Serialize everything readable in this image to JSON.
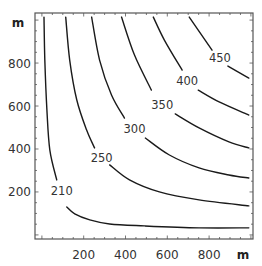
{
  "chart_data": {
    "type": "contour",
    "title": "",
    "xlabel": "m",
    "ylabel": "m",
    "xlim": [
      -33,
      1010
    ],
    "ylim": [
      -19,
      1033
    ],
    "x_ticks": [
      200,
      400,
      600,
      800
    ],
    "y_ticks": [
      200,
      400,
      600,
      800
    ],
    "x_tick_labels": [
      "200",
      "400",
      "600",
      "800"
    ],
    "y_tick_labels": [
      "200",
      "400",
      "600",
      "800"
    ],
    "minor_tick_step": 50,
    "grid": false,
    "legend": "none",
    "contours": [
      {
        "level": 210,
        "label": "210",
        "label_pos": [
          95,
          205
        ],
        "segments": [
          [
            [
              10,
              1014
            ],
            [
              14,
              814
            ],
            [
              24,
              581
            ],
            [
              38,
              395
            ],
            [
              71,
              256
            ]
          ],
          [
            [
              119,
              130
            ],
            [
              157,
              98
            ],
            [
              229,
              70
            ],
            [
              324,
              51
            ],
            [
              490,
              42
            ],
            [
              752,
              33
            ],
            [
              990,
              33
            ]
          ]
        ]
      },
      {
        "level": 250,
        "label": "250",
        "label_pos": [
          286,
          358
        ],
        "segments": [
          [
            [
              114,
              1014
            ],
            [
              133,
              814
            ],
            [
              167,
              628
            ],
            [
              214,
              488
            ],
            [
              252,
              405
            ]
          ],
          [
            [
              324,
              326
            ],
            [
              419,
              256
            ],
            [
              562,
              200
            ],
            [
              752,
              163
            ],
            [
              990,
              135
            ]
          ]
        ]
      },
      {
        "level": 300,
        "label": "300",
        "label_pos": [
          443,
          493
        ],
        "segments": [
          [
            [
              238,
              1014
            ],
            [
              276,
              814
            ],
            [
              333,
              651
            ],
            [
              395,
              544
            ]
          ],
          [
            [
              495,
              451
            ],
            [
              610,
              372
            ],
            [
              752,
              312
            ],
            [
              895,
              279
            ],
            [
              990,
              265
            ]
          ]
        ]
      },
      {
        "level": 350,
        "label": "350",
        "label_pos": [
          576,
          605
        ],
        "segments": [
          [
            [
              381,
              1014
            ],
            [
              443,
              837
            ],
            [
              524,
              674
            ]
          ],
          [
            [
              638,
              563
            ],
            [
              752,
              498
            ],
            [
              895,
              433
            ],
            [
              990,
              405
            ]
          ]
        ]
      },
      {
        "level": 400,
        "label": "400",
        "label_pos": [
          695,
          716
        ],
        "segments": [
          [
            [
              533,
              1014
            ],
            [
              586,
              907
            ],
            [
              671,
              767
            ]
          ],
          [
            [
              748,
              674
            ],
            [
              848,
              619
            ],
            [
              990,
              558
            ]
          ]
        ]
      },
      {
        "level": 450,
        "label": "450",
        "label_pos": [
          852,
          823
        ],
        "segments": [
          [
            [
              705,
              1014
            ],
            [
              814,
              860
            ]
          ],
          [
            [
              890,
              786
            ],
            [
              990,
              730
            ]
          ]
        ]
      }
    ]
  }
}
